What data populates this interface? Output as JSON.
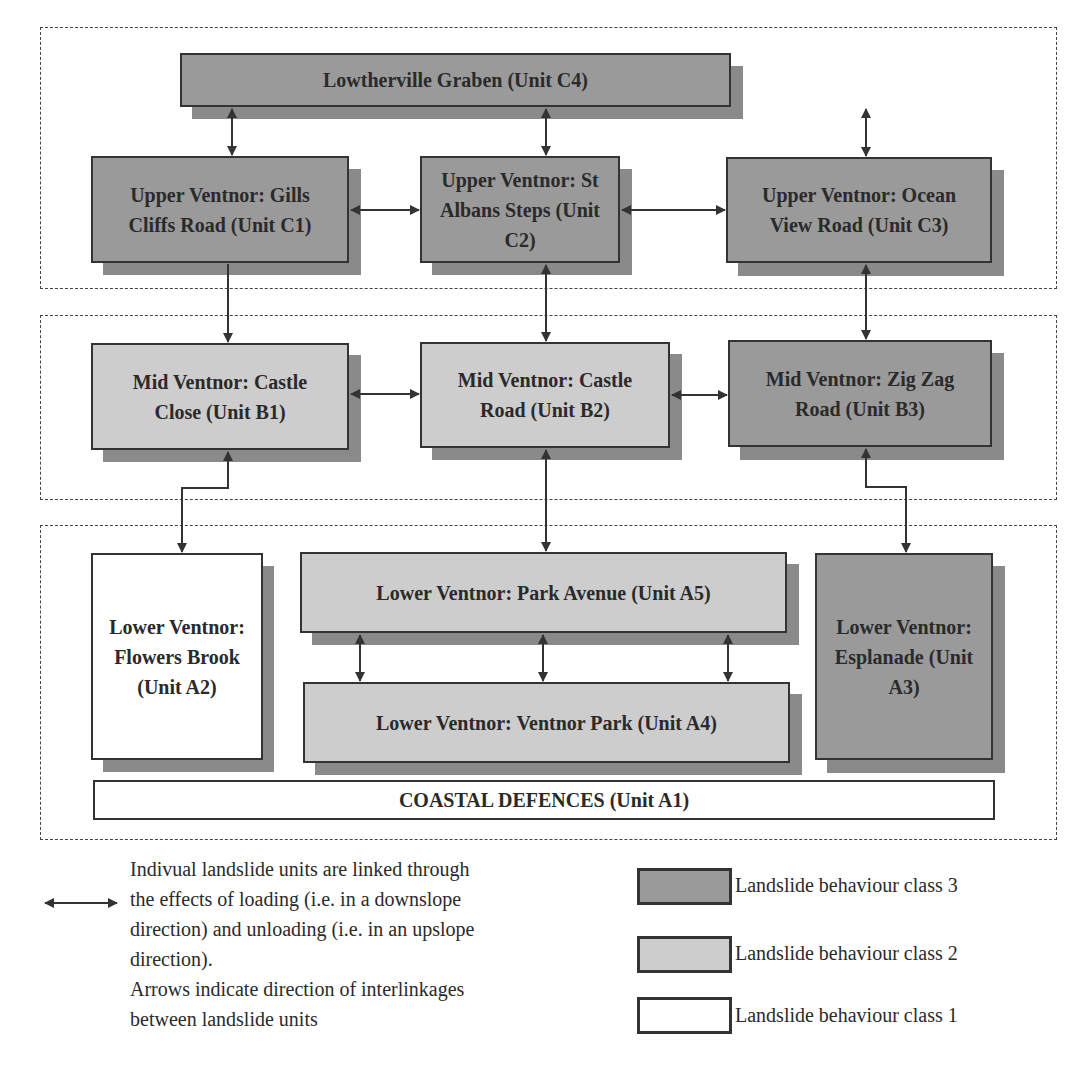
{
  "diagram": {
    "type": "landslide-unit-interlinkage",
    "groups": [
      {
        "id": "upper",
        "label": "Upper zone (C units)"
      },
      {
        "id": "mid",
        "label": "Mid zone (B units)"
      },
      {
        "id": "lower",
        "label": "Lower zone (A units)"
      }
    ],
    "units": {
      "C4": {
        "label": "Lowtherville Graben (Unit C4)",
        "class": 3
      },
      "C1": {
        "label": "Upper Ventnor: Gills Cliffs Road (Unit C1)",
        "class": 3
      },
      "C2": {
        "label": "Upper Ventnor: St Albans Steps (Unit C2)",
        "class": 3
      },
      "C3": {
        "label": "Upper Ventnor: Ocean View Road (Unit C3)",
        "class": 3
      },
      "B1": {
        "label": "Mid Ventnor: Castle Close (Unit B1)",
        "class": 2
      },
      "B2": {
        "label": "Mid Ventnor: Castle Road (Unit B2)",
        "class": 2
      },
      "B3": {
        "label": "Mid Ventnor: Zig Zag Road (Unit B3)",
        "class": 3
      },
      "A2": {
        "label": "Lower Ventnor: Flowers Brook (Unit A2)",
        "class": 1
      },
      "A5": {
        "label": "Lower Ventnor: Park Avenue (Unit A5)",
        "class": 2
      },
      "A4": {
        "label": "Lower Ventnor: Ventnor Park (Unit A4)",
        "class": 2
      },
      "A3": {
        "label": "Lower Ventnor: Esplanade (Unit A3)",
        "class": 3
      },
      "A1": {
        "label": "COASTAL DEFENCES (Unit A1)",
        "class": 1
      }
    },
    "links": [
      {
        "from": "C4",
        "to": "C1",
        "type": "bidirectional"
      },
      {
        "from": "C4",
        "to": "C2",
        "type": "bidirectional"
      },
      {
        "from": "C4",
        "to": "C3",
        "type": "bidirectional"
      },
      {
        "from": "C1",
        "to": "C2",
        "type": "bidirectional"
      },
      {
        "from": "C2",
        "to": "C3",
        "type": "bidirectional"
      },
      {
        "from": "C1",
        "to": "B1",
        "type": "downslope"
      },
      {
        "from": "C2",
        "to": "B2",
        "type": "bidirectional"
      },
      {
        "from": "C3",
        "to": "B3",
        "type": "bidirectional"
      },
      {
        "from": "B1",
        "to": "B2",
        "type": "bidirectional"
      },
      {
        "from": "B2",
        "to": "B3",
        "type": "bidirectional"
      },
      {
        "from": "B1",
        "to": "A2",
        "type": "bidirectional"
      },
      {
        "from": "B2",
        "to": "A5",
        "type": "bidirectional"
      },
      {
        "from": "B3",
        "to": "A3",
        "type": "bidirectional"
      },
      {
        "from": "A5",
        "to": "A4",
        "type": "bidirectional",
        "count": 3
      }
    ]
  },
  "legend": {
    "arrow_description": "Indivual landslide units are linked through the effects of loading (i.e. in a downslope direction) and unloading (i.e. in an upslope direction).",
    "arrow_note": "Arrows indicate direction of interlinkages between landslide units",
    "lines": [
      "Indivual landslide units are linked through",
      "the effects of loading (i.e. in a downslope",
      "direction) and unloading (i.e. in an upslope",
      "direction).",
      "Arrows indicate direction of interlinkages",
      "between landslide units"
    ],
    "classes": [
      {
        "label": "Landslide behaviour class 3",
        "color": "#9a9a9a"
      },
      {
        "label": "Landslide behaviour class 2",
        "color": "#cdcdcd"
      },
      {
        "label": "Landslide behaviour class 1",
        "color": "#ffffff"
      }
    ]
  },
  "colors": {
    "class3": "#9a9a9a",
    "class2": "#cdcdcd",
    "class1": "#ffffff",
    "shadow": "#8a8a8a",
    "border": "#333333"
  }
}
